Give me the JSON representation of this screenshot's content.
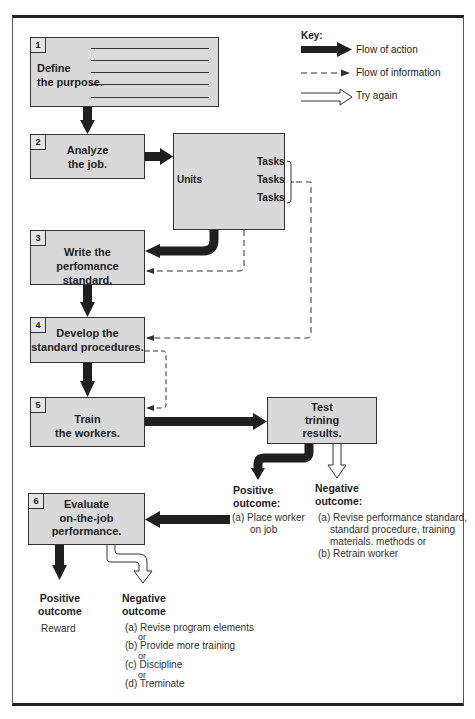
{
  "key": {
    "title": "Key:",
    "items": [
      {
        "icon": "solid-arrow-icon",
        "label": "Flow of action"
      },
      {
        "icon": "dashed-arrow-icon",
        "label": "Flow of information"
      },
      {
        "icon": "hollow-arrow-icon",
        "label": "Try again"
      }
    ]
  },
  "steps": [
    {
      "number": "1",
      "line1": "Define",
      "line2": "the purpose."
    },
    {
      "number": "2",
      "line1": "Analyze",
      "line2": "the job."
    },
    {
      "number": "3",
      "line1": "Write the",
      "line2": "perfomance standard."
    },
    {
      "number": "4",
      "line1": "Develop the",
      "line2": "standard procedures."
    },
    {
      "number": "5",
      "line1": "Train",
      "line2": "the workers."
    },
    {
      "number": "6",
      "line1": "Evaluate",
      "line2": "on-the-job",
      "line3": "performance."
    }
  ],
  "analysis_box": {
    "units_label": "Units",
    "tasks": [
      "Tasks",
      "Tasks",
      "Tasks"
    ]
  },
  "test_box": {
    "line1": "Test",
    "line2": "trining",
    "line3": "results."
  },
  "test_outcomes": {
    "positive": {
      "heading1": "Positive",
      "heading2": "outcome:",
      "items": [
        "(a) Place worker",
        "on job"
      ]
    },
    "negative": {
      "heading1": "Negative",
      "heading2": "outcome:",
      "items": [
        "(a) Revise performance standard,",
        "standard procedure, training",
        "materials. methods or",
        "(b)  Retrain worker"
      ]
    }
  },
  "evaluation_outcomes": {
    "positive": {
      "heading1": "Positive",
      "heading2": "outcome",
      "items": [
        "Reward"
      ]
    },
    "negative": {
      "heading1": "Negative",
      "heading2": "outcome",
      "items": [
        "(a) Revise program elements",
        "or",
        "(b) Provide more training",
        "or",
        "(c) Discipline",
        "or",
        "(d) Treminate"
      ]
    }
  },
  "colors": {
    "box_fill": "#d9d9d9",
    "arrow": "#1f1f1f",
    "border": "#333333"
  }
}
